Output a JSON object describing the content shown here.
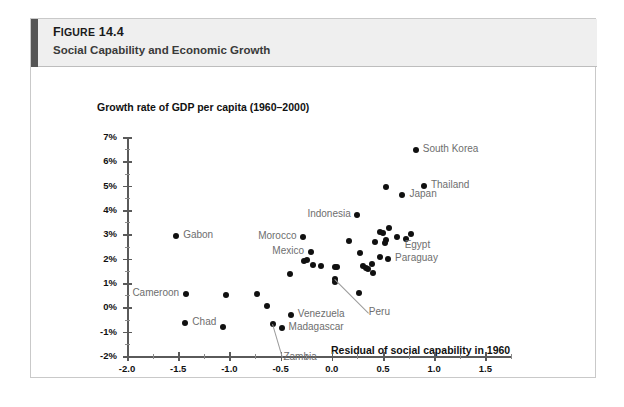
{
  "figure": {
    "number_prefix": "F",
    "number_rest": "IGURE",
    "number_full": "Figure 14.4",
    "number_value": "14.4",
    "title": "Social Capability and Economic Growth"
  },
  "chart_data": {
    "type": "scatter",
    "title": "Social Capability and Economic Growth",
    "ylabel": "Growth rate of GDP per capita (1960–2000)",
    "xlabel": "Residual of social capability in 1960",
    "xlim": [
      -2.0,
      1.75
    ],
    "ylim": [
      -2,
      7
    ],
    "grid": false,
    "legend": null,
    "x_ticks": [
      "-2.0",
      "-1.5",
      "-1.0",
      "-0.5",
      "0.0",
      "0.5",
      "1.0",
      "1.5"
    ],
    "x_tick_values": [
      -2.0,
      -1.5,
      -1.0,
      -0.5,
      0.0,
      0.5,
      1.0,
      1.5
    ],
    "y_ticks": [
      "-2%",
      "-1%",
      "0%",
      "1%",
      "2%",
      "3%",
      "4%",
      "5%",
      "6%",
      "7%"
    ],
    "y_tick_values": [
      -2,
      -1,
      0,
      1,
      2,
      3,
      4,
      5,
      6,
      7
    ],
    "x_minor_step": 0.25,
    "y_minor_step": 0.5,
    "points": [
      {
        "label": "South Korea",
        "x": 0.82,
        "y": 6.45,
        "label_pos": "right"
      },
      {
        "label": "Thailand",
        "x": 0.9,
        "y": 5.0,
        "label_pos": "right"
      },
      {
        "label": "Japan",
        "x": 0.69,
        "y": 4.62,
        "label_pos": "right"
      },
      {
        "label": "",
        "x": 0.53,
        "y": 4.95,
        "label_pos": "none"
      },
      {
        "label": "Indonesia",
        "x": 0.25,
        "y": 3.8,
        "label_pos": "left"
      },
      {
        "label": "Gabon",
        "x": -1.52,
        "y": 2.92,
        "label_pos": "right"
      },
      {
        "label": "Morocco",
        "x": -0.28,
        "y": 2.9,
        "label_pos": "left"
      },
      {
        "label": "Egypt",
        "x": 0.77,
        "y": 3.0,
        "label_pos": "below-right"
      },
      {
        "label": "",
        "x": 0.56,
        "y": 3.28,
        "label_pos": "none"
      },
      {
        "label": "",
        "x": 0.47,
        "y": 3.1,
        "label_pos": "none"
      },
      {
        "label": "",
        "x": 0.5,
        "y": 3.05,
        "label_pos": "none"
      },
      {
        "label": "",
        "x": 0.53,
        "y": 2.78,
        "label_pos": "none"
      },
      {
        "label": "",
        "x": 0.52,
        "y": 2.66,
        "label_pos": "none"
      },
      {
        "label": "",
        "x": 0.64,
        "y": 2.9,
        "label_pos": "none"
      },
      {
        "label": "",
        "x": 0.72,
        "y": 2.8,
        "label_pos": "none"
      },
      {
        "label": "",
        "x": 0.17,
        "y": 2.72,
        "label_pos": "none"
      },
      {
        "label": "",
        "x": 0.42,
        "y": 2.7,
        "label_pos": "none"
      },
      {
        "label": "Mexico",
        "x": -0.2,
        "y": 2.28,
        "label_pos": "left"
      },
      {
        "label": "",
        "x": 0.28,
        "y": 2.24,
        "label_pos": "none"
      },
      {
        "label": "Paraguay",
        "x": 0.55,
        "y": 2.0,
        "label_pos": "right"
      },
      {
        "label": "",
        "x": 0.47,
        "y": 2.08,
        "label_pos": "none"
      },
      {
        "label": "",
        "x": -0.27,
        "y": 1.9,
        "label_pos": "none"
      },
      {
        "label": "",
        "x": -0.24,
        "y": 1.96,
        "label_pos": "none"
      },
      {
        "label": "",
        "x": -0.18,
        "y": 1.72,
        "label_pos": "none"
      },
      {
        "label": "",
        "x": -0.11,
        "y": 1.68,
        "label_pos": "none"
      },
      {
        "label": "",
        "x": 0.03,
        "y": 1.64,
        "label_pos": "none"
      },
      {
        "label": "",
        "x": 0.05,
        "y": 1.66,
        "label_pos": "none"
      },
      {
        "label": "",
        "x": 0.33,
        "y": 1.62,
        "label_pos": "none"
      },
      {
        "label": "",
        "x": 0.35,
        "y": 1.58,
        "label_pos": "none"
      },
      {
        "label": "",
        "x": 0.3,
        "y": 1.68,
        "label_pos": "none"
      },
      {
        "label": "",
        "x": 0.4,
        "y": 1.4,
        "label_pos": "none"
      },
      {
        "label": "",
        "x": 0.39,
        "y": 1.78,
        "label_pos": "none"
      },
      {
        "label": "",
        "x": -0.41,
        "y": 1.38,
        "label_pos": "none"
      },
      {
        "label": "Peru",
        "x": 0.03,
        "y": 1.18,
        "label_pos": "leader"
      },
      {
        "label": "",
        "x": 0.03,
        "y": 1.05,
        "label_pos": "none"
      },
      {
        "label": "",
        "x": 0.27,
        "y": 0.6,
        "label_pos": "none"
      },
      {
        "label": "Cameroon",
        "x": -1.42,
        "y": 0.55,
        "label_pos": "left"
      },
      {
        "label": "",
        "x": -1.03,
        "y": 0.52,
        "label_pos": "none"
      },
      {
        "label": "",
        "x": -0.73,
        "y": 0.55,
        "label_pos": "none"
      },
      {
        "label": "",
        "x": -0.63,
        "y": 0.06,
        "label_pos": "none"
      },
      {
        "label": "Venezuela",
        "x": -0.4,
        "y": -0.3,
        "label_pos": "right"
      },
      {
        "label": "Chad",
        "x": -1.43,
        "y": -0.65,
        "label_pos": "right"
      },
      {
        "label": "",
        "x": -1.06,
        "y": -0.82,
        "label_pos": "none"
      },
      {
        "label": "Zambia",
        "x": -0.57,
        "y": -0.7,
        "label_pos": "leader"
      },
      {
        "label": "Madagascar",
        "x": -0.49,
        "y": -0.86,
        "label_pos": "right"
      }
    ]
  },
  "axes": {
    "y_title": "Growth rate of GDP per capita (1960–2000)",
    "x_title": "Residual of social capability in 1960"
  }
}
